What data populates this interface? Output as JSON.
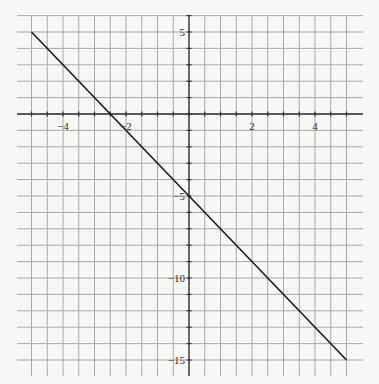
{
  "chart_data": {
    "type": "line",
    "title": "",
    "xlabel": "",
    "ylabel": "",
    "xlim": [
      -5,
      5
    ],
    "ylim": [
      -15.5,
      5.5
    ],
    "grid": true,
    "x_grid_step": 0.5,
    "y_grid_step": 1,
    "x_tick_labels": [
      "-4",
      "-2",
      "2",
      "4"
    ],
    "x_tick_values": [
      -4,
      -2,
      2,
      4
    ],
    "y_tick_labels": [
      "5",
      "-5",
      "-10",
      "-15"
    ],
    "y_tick_values": [
      5,
      -5,
      -10,
      -15
    ],
    "series": [
      {
        "name": "y = -2x - 5",
        "x": [
          -5,
          5
        ],
        "y": [
          5,
          -15
        ],
        "color": "#1a1a1a"
      }
    ],
    "colors": {
      "grid": "#a8a8a8",
      "axis": "#333333",
      "line": "#1a1a1a",
      "background": "#f7f7f5"
    }
  }
}
